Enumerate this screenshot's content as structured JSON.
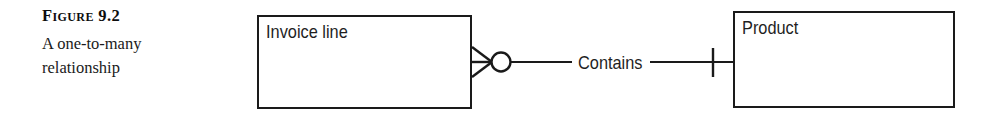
{
  "figure": {
    "label": "Figure 9.2",
    "description": "A one-to-many relationship"
  },
  "diagram": {
    "type": "entity-relationship-diagram",
    "notation": "crow's foot",
    "entities": [
      {
        "id": "invoice-line",
        "name": "Invoice line",
        "x": 257,
        "y": 15,
        "width": 215,
        "height": 94
      },
      {
        "id": "product",
        "name": "Product",
        "x": 733,
        "y": 11,
        "width": 222,
        "height": 97
      }
    ],
    "relationship": {
      "label": "Contains",
      "from": "invoice-line",
      "to": "product",
      "from_cardinality": "zero-or-many",
      "to_cardinality": "exactly-one",
      "from_symbol": "crows-foot-with-circle",
      "to_symbol": "single-tick"
    },
    "colors": {
      "line": "#1a1a1a",
      "text": "#1f1f1f",
      "background": "#ffffff"
    }
  }
}
